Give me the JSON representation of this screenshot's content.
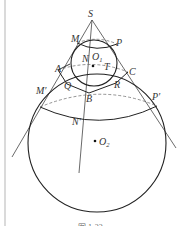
{
  "figure": {
    "caption": "图 1-22",
    "points": {
      "S": "S",
      "M": "M",
      "P": "P",
      "N": "N",
      "O1": "O",
      "O1_sub": "1",
      "T": "T",
      "A": "A",
      "C": "C",
      "Q": "Q",
      "R": "R",
      "B": "B",
      "M_prime": "M′",
      "P_prime": "P′",
      "N_prime": "N′",
      "O2": "O",
      "O2_sub": "2"
    },
    "colors": {
      "stroke": "#333333",
      "dashed": "#555555",
      "border": "#aaaaaa"
    }
  }
}
